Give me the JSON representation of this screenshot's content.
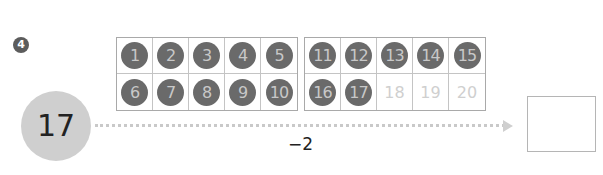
{
  "problem": {
    "number_badge": "4",
    "start_value": "17",
    "operation": "−2",
    "answer": ""
  },
  "ten_frames": [
    {
      "cells": [
        {
          "label": "1",
          "filled": true
        },
        {
          "label": "2",
          "filled": true
        },
        {
          "label": "3",
          "filled": true
        },
        {
          "label": "4",
          "filled": true
        },
        {
          "label": "5",
          "filled": true
        },
        {
          "label": "6",
          "filled": true
        },
        {
          "label": "7",
          "filled": true
        },
        {
          "label": "8",
          "filled": true
        },
        {
          "label": "9",
          "filled": true
        },
        {
          "label": "10",
          "filled": true
        }
      ]
    },
    {
      "cells": [
        {
          "label": "11",
          "filled": true
        },
        {
          "label": "12",
          "filled": true
        },
        {
          "label": "13",
          "filled": true
        },
        {
          "label": "14",
          "filled": true
        },
        {
          "label": "15",
          "filled": true
        },
        {
          "label": "16",
          "filled": true
        },
        {
          "label": "17",
          "filled": true
        },
        {
          "label": "18",
          "filled": false
        },
        {
          "label": "19",
          "filled": false
        },
        {
          "label": "20",
          "filled": false
        }
      ]
    }
  ],
  "colors": {
    "filled_dot": "#6a6a6a",
    "dot_text": "#c8c8c8",
    "empty_text": "#cfcfcf",
    "start_circle": "#cfcfcf"
  }
}
